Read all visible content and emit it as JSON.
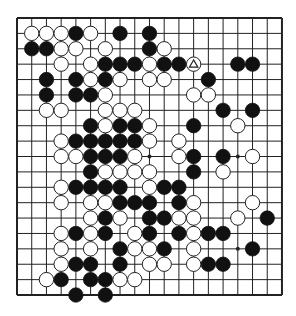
{
  "board": {
    "size": 19,
    "origin_x": 17,
    "origin_y": 18,
    "cell_w": 14.72,
    "cell_h": 15.39,
    "stone_radius": 7.2,
    "line_color": "#222222",
    "black_color": "#111111",
    "white_color": "#ffffff",
    "star_points": [
      [
        9,
        9
      ],
      [
        9,
        15
      ],
      [
        15,
        15
      ]
    ],
    "marked_stone": {
      "row": 3,
      "col": 12,
      "color": "white",
      "mark": "triangle"
    },
    "rows": [
      {
        "row": 0,
        "black": [],
        "white": []
      },
      {
        "row": 1,
        "black": [
          4,
          7,
          9
        ],
        "white": [
          1,
          2,
          3,
          5
        ]
      },
      {
        "row": 2,
        "black": [
          1,
          2,
          9
        ],
        "white": [
          3,
          4,
          6,
          10
        ]
      },
      {
        "row": 3,
        "black": [
          6,
          7,
          8,
          10,
          11,
          15,
          16
        ],
        "white": [
          3,
          5,
          9,
          12
        ]
      },
      {
        "row": 4,
        "black": [
          2,
          4,
          6,
          13
        ],
        "white": [
          5,
          7,
          9,
          10
        ]
      },
      {
        "row": 5,
        "black": [
          2,
          4,
          5
        ],
        "white": [
          6,
          12,
          13
        ]
      },
      {
        "row": 6,
        "black": [
          14,
          16
        ],
        "white": [
          2,
          3,
          6,
          7,
          8
        ]
      },
      {
        "row": 7,
        "black": [
          5,
          7,
          8,
          12
        ],
        "white": [
          6,
          9,
          15
        ]
      },
      {
        "row": 8,
        "black": [
          4,
          5,
          6,
          7,
          8
        ],
        "white": [
          3,
          9,
          11
        ]
      },
      {
        "row": 9,
        "black": [
          5,
          6,
          7,
          12,
          14
        ],
        "white": [
          3,
          4,
          8,
          11,
          16
        ]
      },
      {
        "row": 10,
        "black": [
          5,
          12
        ],
        "white": [
          6,
          7,
          8,
          9,
          14
        ]
      },
      {
        "row": 11,
        "black": [
          4,
          5,
          6,
          7,
          10,
          11
        ],
        "white": [
          3,
          9
        ]
      },
      {
        "row": 12,
        "black": [
          7,
          8,
          9,
          11
        ],
        "white": [
          3,
          5,
          6,
          12,
          16
        ]
      },
      {
        "row": 13,
        "black": [
          6,
          9,
          10,
          17
        ],
        "white": [
          5,
          7,
          11,
          12,
          15
        ]
      },
      {
        "row": 14,
        "black": [
          4,
          6,
          9,
          11,
          13,
          14
        ],
        "white": [
          3,
          5,
          8,
          12
        ]
      },
      {
        "row": 15,
        "black": [
          7,
          10,
          16
        ],
        "white": [
          3,
          5,
          8,
          9,
          12
        ]
      },
      {
        "row": 16,
        "black": [
          4,
          5,
          7,
          13,
          14
        ],
        "white": [
          3,
          9,
          10,
          12
        ]
      },
      {
        "row": 17,
        "black": [
          3,
          5,
          6
        ],
        "white": [
          2,
          7,
          8
        ]
      },
      {
        "row": 18,
        "black": [
          4,
          6
        ],
        "white": []
      }
    ]
  }
}
